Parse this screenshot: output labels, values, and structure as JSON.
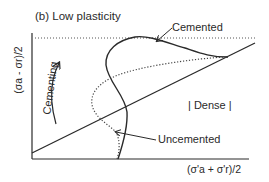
{
  "figure": {
    "title": "(b) Low plasticity",
    "axes": {
      "x_label": "(σ'a + σ'r)/2",
      "y_label": "(σa - σr)/2"
    },
    "annotations": {
      "cemented": "Cemented",
      "uncemented": "Uncemented",
      "dense": "| Dense |",
      "cementing": "Cementing"
    },
    "lines": {
      "critical_state_line": "solid straight line from lower-left to upper-right",
      "cemented_path": "solid curve",
      "uncemented_path": "dotted curve",
      "peak_reference": "dotted horizontal line"
    },
    "colors": {
      "ink": "#2a2a2a",
      "background": "#ffffff"
    }
  }
}
